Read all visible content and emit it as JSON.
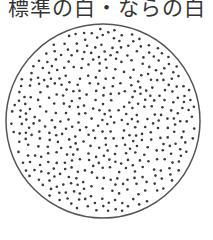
{
  "title": "標準の白・ならの白",
  "figure": {
    "shape": "circle",
    "center": [
      103,
      121
    ],
    "radius": 97,
    "stroke_color": "#555555",
    "dot_color": "#3a3a3a",
    "dot_radius": 1.3,
    "dot_count": 430,
    "seed": 7
  }
}
